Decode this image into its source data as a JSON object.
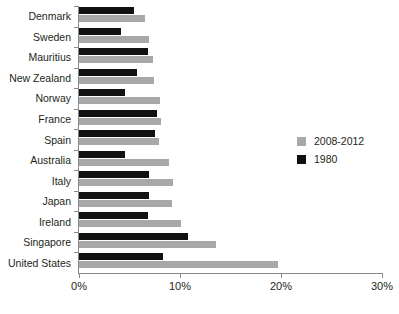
{
  "chart_data": {
    "type": "bar",
    "orientation": "horizontal",
    "title": "",
    "subtitle": "",
    "xlabel": "",
    "ylabel": "",
    "xlim": [
      0,
      30
    ],
    "xticks": [
      0,
      10,
      20,
      30
    ],
    "xtick_labels": [
      "0%",
      "10%",
      "20%",
      "30%"
    ],
    "grid": false,
    "legend_position": "right",
    "value_unit": "%",
    "categories": [
      "Denmark",
      "Sweden",
      "Mauritius",
      "New Zealand",
      "Norway",
      "France",
      "Spain",
      "Australia",
      "Italy",
      "Japan",
      "Ireland",
      "Singapore",
      "United States"
    ],
    "series": [
      {
        "name": "2008-2012",
        "color": "#a8a8a8",
        "values": [
          6.5,
          6.9,
          7.3,
          7.4,
          8.0,
          8.1,
          7.9,
          8.9,
          9.3,
          9.2,
          10.1,
          13.6,
          19.7
        ]
      },
      {
        "name": "1980",
        "color": "#111111",
        "values": [
          5.4,
          4.2,
          6.8,
          5.7,
          4.6,
          7.7,
          7.5,
          4.6,
          6.9,
          6.9,
          6.8,
          10.8,
          8.3
        ]
      }
    ]
  }
}
